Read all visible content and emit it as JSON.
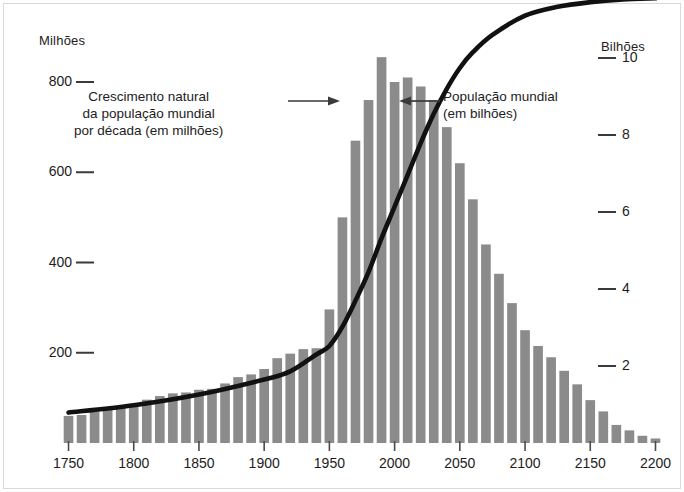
{
  "axes": {
    "left_title": "Milhões",
    "right_title": "Bilhões",
    "left_ticks": [
      "800",
      "600",
      "400",
      "200"
    ],
    "right_ticks": [
      "10",
      "8",
      "6",
      "4",
      "2"
    ],
    "x_ticks": [
      "1750",
      "1800",
      "1850",
      "1900",
      "1950",
      "2000",
      "2050",
      "2100",
      "2150",
      "2200"
    ]
  },
  "annotations": {
    "bars": {
      "line1": "Crescimento natural",
      "line2": "da população mundial",
      "line3": "por década (em milhões)"
    },
    "curve": {
      "line1": "População mundial",
      "line2": "(em bilhões)"
    }
  },
  "colors": {
    "bar": "#8b8b8b",
    "curve": "#111111",
    "text": "#1c1c1c",
    "background": "#ffffff"
  },
  "chart_data": {
    "type": "bar",
    "title": "",
    "subtitle": "",
    "xlabel": "",
    "ylabel": "Milhões",
    "y2label": "Bilhões",
    "grid": false,
    "legend": "none",
    "xlim": [
      1750,
      2200
    ],
    "ylim": [
      0,
      900
    ],
    "y2lim": [
      0,
      11.6
    ],
    "x_tick_values": [
      1750,
      1800,
      1850,
      1900,
      1950,
      2000,
      2050,
      2100,
      2150,
      2200
    ],
    "y_tick_values": [
      200,
      400,
      600,
      800
    ],
    "y2_tick_values": [
      2,
      4,
      6,
      8,
      10
    ],
    "categories": [
      1750,
      1760,
      1770,
      1780,
      1790,
      1800,
      1810,
      1820,
      1830,
      1840,
      1850,
      1860,
      1870,
      1880,
      1890,
      1900,
      1910,
      1920,
      1930,
      1940,
      1950,
      1960,
      1970,
      1980,
      1990,
      2000,
      2010,
      2020,
      2030,
      2040,
      2050,
      2060,
      2070,
      2080,
      2090,
      2100,
      2110,
      2120,
      2130,
      2140,
      2150,
      2160,
      2170,
      2180,
      2190,
      2200
    ],
    "series": [
      {
        "name": "Crescimento natural da população mundial por década (em milhões)",
        "unit": "milhões por década",
        "axis": "left",
        "type": "bar",
        "values": [
          60,
          62,
          70,
          78,
          80,
          82,
          96,
          104,
          110,
          112,
          118,
          120,
          132,
          146,
          152,
          164,
          188,
          198,
          208,
          210,
          296,
          500,
          670,
          760,
          855,
          800,
          810,
          790,
          760,
          700,
          620,
          540,
          440,
          375,
          310,
          250,
          215,
          190,
          160,
          130,
          95,
          70,
          40,
          28,
          16,
          10
        ]
      },
      {
        "name": "População mundial (em bilhões)",
        "unit": "bilhões",
        "axis": "right",
        "type": "line",
        "x": [
          1750,
          1800,
          1850,
          1900,
          1920,
          1940,
          1950,
          1960,
          1970,
          1980,
          1990,
          2000,
          2010,
          2020,
          2030,
          2040,
          2050,
          2060,
          2075,
          2100,
          2125,
          2150,
          2175,
          2200
        ],
        "values": [
          0.79,
          0.98,
          1.26,
          1.65,
          1.86,
          2.3,
          2.52,
          3.02,
          3.7,
          4.44,
          5.32,
          6.14,
          6.96,
          7.79,
          8.55,
          9.2,
          9.74,
          10.15,
          10.6,
          11.1,
          11.33,
          11.45,
          11.52,
          11.55
        ]
      }
    ]
  }
}
